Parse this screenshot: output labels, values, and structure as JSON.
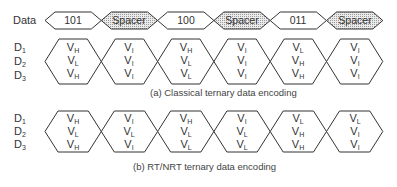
{
  "data_row": {
    "label": "Data",
    "symbols": [
      {
        "text": "101",
        "type": "data"
      },
      {
        "text": "Spacer",
        "type": "spacer"
      },
      {
        "text": "100",
        "type": "data"
      },
      {
        "text": "Spacer",
        "type": "spacer"
      },
      {
        "text": "011",
        "type": "data"
      },
      {
        "text": "Spacer",
        "type": "spacer"
      }
    ]
  },
  "rail_labels": [
    {
      "base": "D",
      "sub": "1"
    },
    {
      "base": "D",
      "sub": "2"
    },
    {
      "base": "D",
      "sub": "3"
    }
  ],
  "classical": {
    "caption": "(a) Classical ternary data encoding",
    "columns": [
      [
        {
          "b": "V",
          "s": "H"
        },
        {
          "b": "V",
          "s": "L"
        },
        {
          "b": "V",
          "s": "H"
        }
      ],
      [
        {
          "b": "V",
          "s": "I"
        },
        {
          "b": "V",
          "s": "I"
        },
        {
          "b": "V",
          "s": "I"
        }
      ],
      [
        {
          "b": "V",
          "s": "H"
        },
        {
          "b": "V",
          "s": "L"
        },
        {
          "b": "V",
          "s": "L"
        }
      ],
      [
        {
          "b": "V",
          "s": "I"
        },
        {
          "b": "V",
          "s": "I"
        },
        {
          "b": "V",
          "s": "I"
        }
      ],
      [
        {
          "b": "V",
          "s": "L"
        },
        {
          "b": "V",
          "s": "H"
        },
        {
          "b": "V",
          "s": "H"
        }
      ],
      [
        {
          "b": "V",
          "s": "I"
        },
        {
          "b": "V",
          "s": "I"
        },
        {
          "b": "V",
          "s": "I"
        }
      ]
    ]
  },
  "rtnrt": {
    "caption": "(b) RT/NRT ternary data encoding",
    "columns": [
      [
        {
          "b": "V",
          "s": "H"
        },
        {
          "b": "V",
          "s": "L"
        },
        {
          "b": "V",
          "s": "H"
        }
      ],
      [
        {
          "b": "V",
          "s": "I"
        },
        {
          "b": "V",
          "s": "L"
        },
        {
          "b": "V",
          "s": "I"
        }
      ],
      [
        {
          "b": "V",
          "s": "H"
        },
        {
          "b": "V",
          "s": "L"
        },
        {
          "b": "V",
          "s": "L"
        }
      ],
      [
        {
          "b": "V",
          "s": "I"
        },
        {
          "b": "V",
          "s": "L"
        },
        {
          "b": "V",
          "s": "L"
        }
      ],
      [
        {
          "b": "V",
          "s": "L"
        },
        {
          "b": "V",
          "s": "H"
        },
        {
          "b": "V",
          "s": "H"
        }
      ],
      [
        {
          "b": "V",
          "s": "L"
        },
        {
          "b": "V",
          "s": "I"
        },
        {
          "b": "V",
          "s": "I"
        }
      ]
    ]
  },
  "colors": {
    "stroke": "#333333",
    "spacer_fill": "#d9d9d9",
    "text": "#333333"
  }
}
